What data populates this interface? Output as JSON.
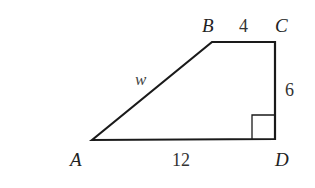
{
  "diagram": {
    "type": "geometry",
    "shape": "trapezoid",
    "vertices": {
      "A": {
        "label": "A",
        "x": 92,
        "y": 140
      },
      "B": {
        "label": "B",
        "x": 212,
        "y": 42
      },
      "C": {
        "label": "C",
        "x": 275,
        "y": 42
      },
      "D": {
        "label": "D",
        "x": 275,
        "y": 139
      }
    },
    "sides": {
      "AB": {
        "label": "w"
      },
      "BC": {
        "label": "4"
      },
      "CD": {
        "label": "6"
      },
      "AD": {
        "label": "12"
      }
    },
    "right_angle_at": "D",
    "colors": {
      "stroke": "#1a1a1a",
      "background": "#ffffff"
    }
  }
}
